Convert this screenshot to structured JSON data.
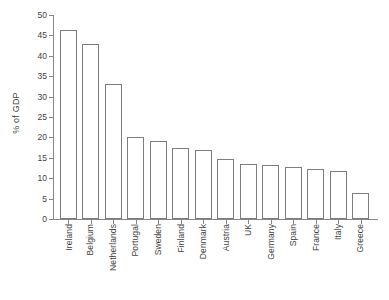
{
  "chart_data": {
    "type": "bar",
    "title": "",
    "subtitle": "",
    "xlabel": "",
    "ylabel": "% of GDP",
    "categories": [
      "Ireland",
      "Belgium",
      "Netherlands",
      "Portugal",
      "Sweden",
      "Finland",
      "Denmark",
      "Austria",
      "UK",
      "Germany",
      "Spain",
      "France",
      "Italy",
      "Greece"
    ],
    "values": [
      46.3,
      42.8,
      33.0,
      20.0,
      19.0,
      17.3,
      16.9,
      14.8,
      13.5,
      13.3,
      12.8,
      12.3,
      11.8,
      6.3
    ],
    "ylim": [
      0,
      50
    ],
    "ytick_labels": [
      "0",
      "5",
      "10",
      "15",
      "20",
      "25",
      "30",
      "35",
      "40",
      "45",
      "50"
    ],
    "ytick_values": [
      0,
      5,
      10,
      15,
      20,
      25,
      30,
      35,
      40,
      45,
      50
    ],
    "grid": false,
    "legend": false,
    "legend_position": "none",
    "bar_fill_color": "#ffffff",
    "bar_edge_color": "#7d7d7d",
    "axis_color": "#878787",
    "text_color": "#3f3f3f",
    "background_color": "#ffffff"
  }
}
